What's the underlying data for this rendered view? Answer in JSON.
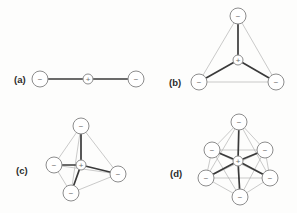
{
  "figure": {
    "background_color": "#fdfdfc",
    "bond_strong_color": "#3a3a3a",
    "bond_faint_color": "#b3b3b3",
    "node_stroke_color": "#8d8d8d",
    "node_fill_color": "#ffffff",
    "label_color": "#2b2b2b",
    "negative_sign": "−",
    "positive_sign": "+"
  },
  "panels": [
    {
      "id": "a",
      "label": "(a)",
      "label_x": 14,
      "label_y": 83,
      "geometry": "linear",
      "negative_count": 2,
      "positive_count": 1,
      "node_radius": 8,
      "center_radius": 5,
      "center": {
        "x": 88,
        "y": 79,
        "sign": "+"
      },
      "vertices": [
        {
          "x": 40,
          "y": 79,
          "sign": "−"
        },
        {
          "x": 136,
          "y": 79,
          "sign": "−"
        }
      ],
      "strong_bonds": [
        [
          0,
          "c"
        ],
        [
          1,
          "c"
        ]
      ],
      "faint_bonds": []
    },
    {
      "id": "b",
      "label": "(b)",
      "label_x": 169,
      "label_y": 86,
      "geometry": "trigonal-planar",
      "negative_count": 3,
      "positive_count": 1,
      "node_radius": 8,
      "center_radius": 5,
      "center": {
        "x": 238,
        "y": 60,
        "sign": "+"
      },
      "vertices": [
        {
          "x": 238,
          "y": 16,
          "sign": "−"
        },
        {
          "x": 199,
          "y": 82,
          "sign": "−"
        },
        {
          "x": 276,
          "y": 82,
          "sign": "−"
        }
      ],
      "strong_bonds": [
        [
          0,
          "c"
        ],
        [
          1,
          "c"
        ],
        [
          2,
          "c"
        ]
      ],
      "faint_bonds": [
        [
          0,
          1
        ],
        [
          0,
          2
        ],
        [
          1,
          2
        ]
      ]
    },
    {
      "id": "c",
      "label": "(c)",
      "label_x": 16,
      "label_y": 174,
      "geometry": "tetrahedral",
      "negative_count": 4,
      "positive_count": 1,
      "node_radius": 8,
      "center_radius": 5,
      "center": {
        "x": 81,
        "y": 165,
        "sign": "+"
      },
      "vertices": [
        {
          "x": 81,
          "y": 126,
          "sign": "−"
        },
        {
          "x": 54,
          "y": 165,
          "sign": "−"
        },
        {
          "x": 118,
          "y": 174,
          "sign": "−"
        },
        {
          "x": 71,
          "y": 193,
          "sign": "−"
        }
      ],
      "strong_bonds": [
        [
          0,
          "c"
        ],
        [
          1,
          "c"
        ],
        [
          2,
          "c"
        ],
        [
          3,
          "c"
        ]
      ],
      "faint_bonds": [
        [
          0,
          1
        ],
        [
          0,
          2
        ],
        [
          0,
          3
        ],
        [
          1,
          2
        ],
        [
          1,
          3
        ],
        [
          2,
          3
        ]
      ]
    },
    {
      "id": "d",
      "label": "(d)",
      "label_x": 170,
      "label_y": 177,
      "geometry": "octahedral",
      "negative_count": 6,
      "positive_count": 1,
      "node_radius": 8,
      "center_radius": 5,
      "center": {
        "x": 238,
        "y": 161,
        "sign": "+"
      },
      "vertices": [
        {
          "x": 239,
          "y": 122,
          "sign": "−"
        },
        {
          "x": 212,
          "y": 150,
          "sign": "−"
        },
        {
          "x": 265,
          "y": 150,
          "sign": "−"
        },
        {
          "x": 206,
          "y": 178,
          "sign": "−"
        },
        {
          "x": 270,
          "y": 178,
          "sign": "−"
        },
        {
          "x": 240,
          "y": 197,
          "sign": "−"
        }
      ],
      "strong_bonds": [
        [
          0,
          "c"
        ],
        [
          1,
          "c"
        ],
        [
          2,
          "c"
        ],
        [
          3,
          "c"
        ],
        [
          4,
          "c"
        ],
        [
          5,
          "c"
        ]
      ],
      "faint_bonds": [
        [
          0,
          1
        ],
        [
          0,
          2
        ],
        [
          0,
          3
        ],
        [
          0,
          4
        ],
        [
          1,
          2
        ],
        [
          1,
          3
        ],
        [
          1,
          4
        ],
        [
          1,
          5
        ],
        [
          2,
          3
        ],
        [
          2,
          4
        ],
        [
          2,
          5
        ],
        [
          3,
          4
        ],
        [
          3,
          5
        ],
        [
          4,
          5
        ]
      ]
    }
  ]
}
